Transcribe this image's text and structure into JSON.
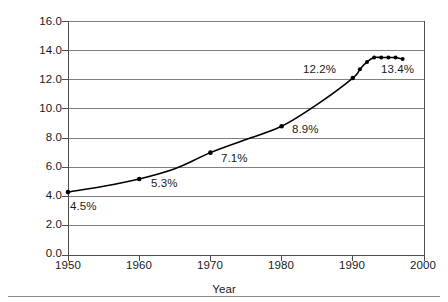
{
  "chart_data": {
    "type": "line",
    "title": "",
    "subtitle": "",
    "xlabel": "Year",
    "ylabel": "% Share of GP",
    "xlim": [
      1950,
      2000
    ],
    "ylim": [
      0.0,
      16.0
    ],
    "grid": "horizontal",
    "legend": "none",
    "xticks": [
      "1950",
      "1960",
      "1970",
      "1980",
      "1990",
      "2000"
    ],
    "xtick_values": [
      1950,
      1960,
      1970,
      1980,
      1990,
      2000
    ],
    "yticks": [
      "0.0",
      "2.0",
      "4.0",
      "6.0",
      "8.0",
      "10.0",
      "12.0",
      "14.0",
      "16.0"
    ],
    "ytick_values": [
      0.0,
      2.0,
      4.0,
      6.0,
      8.0,
      10.0,
      12.0,
      14.0,
      16.0
    ],
    "series": [
      {
        "name": "% Share of GP",
        "x": [
          1950,
          1955,
          1960,
          1965,
          1970,
          1975,
          1980,
          1985,
          1990,
          1991,
          1992,
          1993,
          1994,
          1995,
          1996,
          1997
        ],
        "values": [
          4.3,
          4.7,
          5.2,
          5.9,
          7.0,
          7.9,
          8.8,
          10.3,
          12.1,
          12.7,
          13.2,
          13.5,
          13.5,
          13.5,
          13.5,
          13.4
        ],
        "marker_x": [
          1950,
          1960,
          1970,
          1980,
          1990,
          1991,
          1992,
          1993,
          1994,
          1995,
          1996,
          1997
        ],
        "marker_values": [
          4.3,
          5.2,
          7.0,
          8.8,
          12.1,
          12.7,
          13.2,
          13.5,
          13.5,
          13.5,
          13.5,
          13.4
        ],
        "color": "#000000"
      }
    ],
    "annotations": [
      {
        "name": "label-1950",
        "text": "4.5%",
        "x": 1950,
        "y": 3.6,
        "anchor": "left"
      },
      {
        "name": "label-1960",
        "text": "5.3%",
        "x": 1962,
        "y": 4.6,
        "anchor": "left"
      },
      {
        "name": "label-1970",
        "text": "7.1%",
        "x": 1972,
        "y": 6.3,
        "anchor": "left"
      },
      {
        "name": "label-1980",
        "text": "8.9%",
        "x": 1982,
        "y": 8.2,
        "anchor": "left"
      },
      {
        "name": "label-1990",
        "text": "12.2%",
        "x": 1983,
        "y": 12.6,
        "anchor": "left"
      },
      {
        "name": "label-1997",
        "text": "13.4%",
        "x": 1994,
        "y": 12.6,
        "anchor": "left"
      }
    ]
  },
  "axes": {
    "y_title": "% Share of GP",
    "x_title": "Year",
    "ytick_labels": [
      "16.0",
      "14.0",
      "12.0",
      "10.0",
      "8.0",
      "6.0",
      "4.0",
      "2.0",
      "0.0"
    ],
    "xtick_labels": [
      "1950",
      "1960",
      "1970",
      "1980",
      "1990",
      "2000"
    ]
  },
  "labels": {
    "p1950": "4.5%",
    "p1960": "5.3%",
    "p1970": "7.1%",
    "p1980": "8.9%",
    "p1990": "12.2%",
    "p1997": "13.4%"
  },
  "colors": {
    "line": "#000000",
    "grid": "#7f7f7f",
    "axis": "#4d4d4d",
    "text": "#1a1a1a",
    "rule": "#8a8a8a",
    "background": "#ffffff"
  }
}
